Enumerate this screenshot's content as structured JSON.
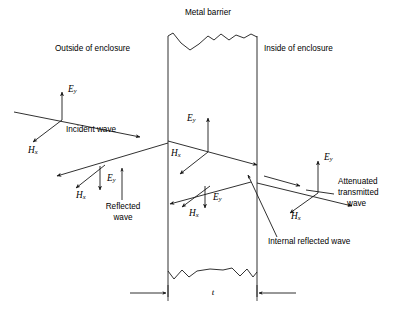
{
  "figure": {
    "type": "schematic",
    "background": "#ffffff",
    "line_color": "#1a1a1a",
    "width": 409,
    "height": 317
  },
  "labels": {
    "metal_barrier": "Metal barrier",
    "outside": "Outside of enclosure",
    "inside": "Inside of enclosure",
    "incident_wave": "Incident wave",
    "reflected_wave_l1": "Reflected",
    "reflected_wave_l2": "wave",
    "internal_reflected_wave": "Internal reflected wave",
    "attenuated_l1": "Attenuated",
    "attenuated_l2": "transmitted",
    "attenuated_l3": "wave",
    "thickness": "t"
  },
  "field_symbols": {
    "E": "E",
    "E_sub": "y",
    "H": "H",
    "H_sub": "x"
  },
  "barrier": {
    "left_wall_x": 168,
    "right_wall_x": 257,
    "top_y": 32,
    "bottom_y": 297,
    "torn_top": true,
    "torn_bottom": true
  },
  "wave_groups": [
    {
      "name": "incident",
      "origin": [
        62,
        120
      ],
      "E_direction": "up",
      "H_direction": "down-left",
      "propagation": "right-down"
    },
    {
      "name": "reflected",
      "origin": [
        100,
        175
      ],
      "E_direction": "down",
      "H_direction": "down-left",
      "propagation": "left-up"
    },
    {
      "name": "transmitted-internal",
      "origin": [
        208,
        152
      ],
      "E_direction": "up",
      "H_direction": "down-left",
      "propagation": "right-down"
    },
    {
      "name": "internal-reflected",
      "origin": [
        205,
        193
      ],
      "E_direction": "down",
      "H_direction": "down-left",
      "propagation": "left-up"
    },
    {
      "name": "attenuated-transmitted",
      "origin": [
        318,
        193
      ],
      "E_direction": "up",
      "H_direction": "down-left",
      "propagation": "right-down"
    }
  ]
}
